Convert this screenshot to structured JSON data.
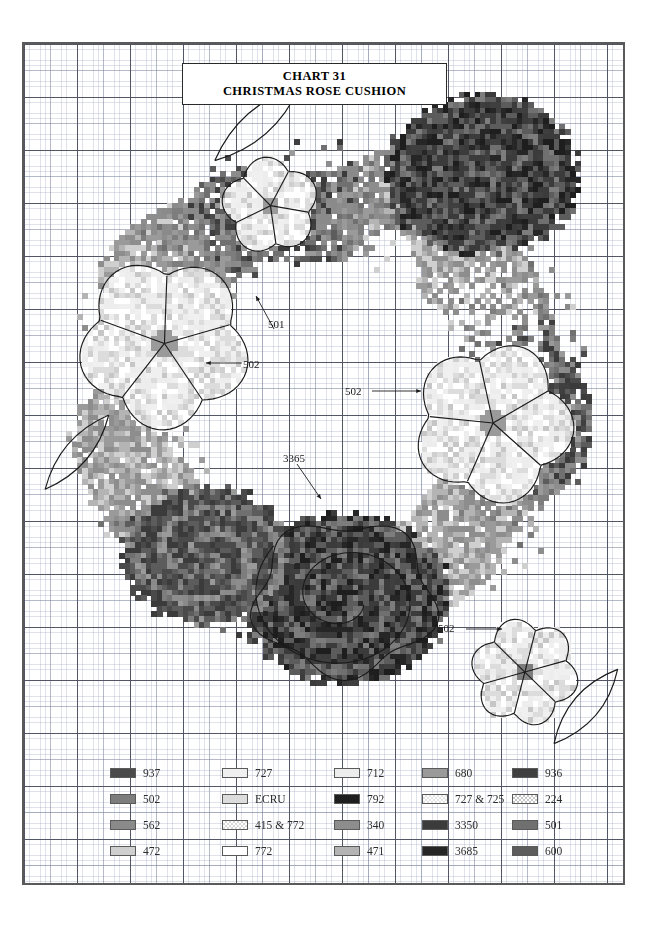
{
  "title": {
    "line1": "CHART 31",
    "line2": "CHRISTMAS ROSE CUSHION"
  },
  "chart_data": {
    "type": "heatmap",
    "subtitle": "Cross-stitch pattern chart",
    "grid": {
      "columns": 114,
      "rows": 159,
      "cell_px": 5.3,
      "minor_every": 5,
      "major_every": 10
    },
    "palette_note": "Grayscale symbol swatches keyed to DMC thread numbers"
  },
  "annotations": [
    {
      "id": "a1",
      "label": "501",
      "x": 268,
      "y": 318,
      "arrow": "up-left"
    },
    {
      "id": "a2",
      "label": "502",
      "x": 243,
      "y": 358,
      "arrow": "left"
    },
    {
      "id": "a3",
      "label": "3365",
      "x": 283,
      "y": 452,
      "arrow": "down-right"
    },
    {
      "id": "a4",
      "label": "502",
      "x": 345,
      "y": 385,
      "arrow": "right"
    },
    {
      "id": "a5",
      "label": "502",
      "x": 438,
      "y": 622,
      "arrow": "right"
    }
  ],
  "legend": {
    "columns": [
      {
        "items": [
          {
            "code": "937",
            "color": "#4a4a4a",
            "pattern": "solid"
          },
          {
            "code": "502",
            "color": "#7d7d7d",
            "pattern": "solid"
          },
          {
            "code": "562",
            "color": "#8a8a8a",
            "pattern": "solid"
          },
          {
            "code": "472",
            "color": "#cfcfcf",
            "pattern": "solid"
          }
        ]
      },
      {
        "items": [
          {
            "code": "727",
            "color": "#f0f0f0",
            "pattern": "solid"
          },
          {
            "code": "ECRU",
            "color": "#dcdcdc",
            "pattern": "solid"
          },
          {
            "code": "415 & 772",
            "color": "#d8d8d8",
            "pattern": "checker"
          },
          {
            "code": "772",
            "color": "#ffffff",
            "pattern": "solid"
          }
        ]
      },
      {
        "items": [
          {
            "code": "712",
            "color": "#ededed",
            "pattern": "solid"
          },
          {
            "code": "792",
            "color": "#1e1e1e",
            "pattern": "solid"
          },
          {
            "code": "340",
            "color": "#8d8d8d",
            "pattern": "solid"
          },
          {
            "code": "471",
            "color": "#b4b4b4",
            "pattern": "solid"
          }
        ]
      },
      {
        "items": [
          {
            "code": "680",
            "color": "#9a9a9a",
            "pattern": "solid"
          },
          {
            "code": "727 & 725",
            "color": "#e4e4e4",
            "pattern": "checker"
          },
          {
            "code": "3350",
            "color": "#3b3b3b",
            "pattern": "solid"
          },
          {
            "code": "3685",
            "color": "#262626",
            "pattern": "solid"
          }
        ]
      },
      {
        "items": [
          {
            "code": "936",
            "color": "#3f3f3f",
            "pattern": "solid"
          },
          {
            "code": "224",
            "color": "#c6c6c6",
            "pattern": "checker"
          },
          {
            "code": "501",
            "color": "#707070",
            "pattern": "solid"
          },
          {
            "code": "600",
            "color": "#5c5c5c",
            "pattern": "solid"
          }
        ]
      }
    ]
  }
}
